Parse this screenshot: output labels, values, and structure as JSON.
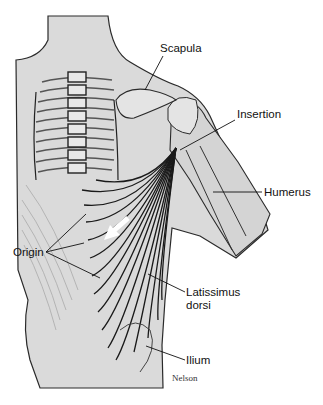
{
  "figure": {
    "labels": {
      "scapula": "Scapula",
      "insertion": "Insertion",
      "humerus": "Humerus",
      "origin": "Origin",
      "latissimus_line1": "Latissimus",
      "latissimus_line2": "dorsi",
      "ilium": "Ilium"
    },
    "signature": "Nelson",
    "colors": {
      "skin": "#d9d9d9",
      "outline": "#2a2a2a",
      "muscle": "#1a1a1a",
      "arrow": "#ffffff"
    }
  }
}
